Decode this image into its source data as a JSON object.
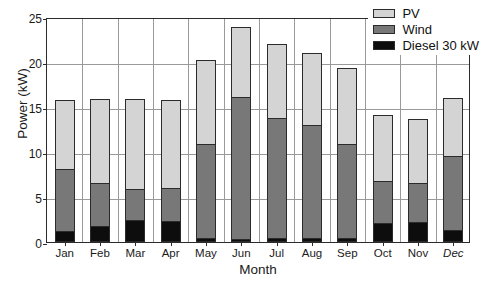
{
  "chart_data": {
    "type": "bar",
    "subtype": "stacked",
    "title": "",
    "xlabel": "Month",
    "ylabel": "Power (kW)",
    "ylim": [
      0,
      25
    ],
    "yticks": [
      0,
      5,
      10,
      15,
      20,
      25
    ],
    "grid": true,
    "legend_position": "top-right",
    "categories": [
      "Jan",
      "Feb",
      "Mar",
      "Apr",
      "May",
      "Jun",
      "Jul",
      "Aug",
      "Sep",
      "Oct",
      "Nov",
      "Dec"
    ],
    "categories_italic": [
      "Dec"
    ],
    "series": [
      {
        "name": "Diesel 30 kW",
        "color": "#0d0d0d",
        "values": [
          1.2,
          1.8,
          2.5,
          2.3,
          0.5,
          0.3,
          0.4,
          0.5,
          0.5,
          2.1,
          2.2,
          1.3
        ]
      },
      {
        "name": "Wind",
        "color": "#787878",
        "values": [
          7.1,
          4.9,
          3.5,
          3.8,
          10.5,
          16.0,
          13.5,
          12.6,
          10.5,
          4.8,
          4.5,
          8.4
        ]
      },
      {
        "name": "PV",
        "color": "#d4d4d4",
        "values": [
          7.7,
          9.5,
          10.2,
          10.0,
          9.5,
          7.9,
          8.4,
          8.2,
          8.6,
          7.5,
          7.2,
          6.6
        ]
      }
    ],
    "cumulative_tops": {
      "diesel": [
        1.2,
        1.8,
        2.5,
        2.3,
        0.5,
        0.3,
        0.4,
        0.5,
        0.5,
        2.1,
        2.2,
        1.3
      ],
      "wind": [
        8.3,
        6.7,
        6.0,
        6.1,
        11.0,
        16.3,
        13.9,
        13.1,
        11.0,
        6.9,
        6.7,
        9.7
      ],
      "total": [
        16.0,
        16.2,
        16.2,
        16.1,
        20.5,
        24.2,
        22.3,
        21.3,
        19.6,
        14.4,
        13.9,
        16.3
      ]
    }
  },
  "legend": {
    "items": [
      {
        "label": "PV",
        "key": "pv"
      },
      {
        "label": "Wind",
        "key": "wind"
      },
      {
        "label": "Diesel 30 kW",
        "key": "diesel"
      }
    ]
  }
}
